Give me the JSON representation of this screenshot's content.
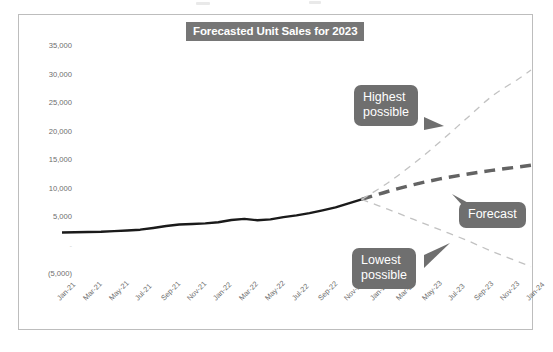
{
  "chart_data": {
    "type": "line",
    "title": "Forecasted Unit Sales for 2023",
    "xlabel": "",
    "ylabel": "",
    "ylim": [
      -5000,
      35000
    ],
    "grid": false,
    "legend_position": "none",
    "yticks": [
      35000,
      30000,
      25000,
      20000,
      15000,
      10000,
      5000,
      0,
      -5000
    ],
    "ytick_labels": [
      "35,000",
      "30,000",
      "25,000",
      "20,000",
      "15,000",
      "10,000",
      "5,000",
      "-",
      "(5,000)"
    ],
    "categories": [
      "Jan-21",
      "Mar-21",
      "May-21",
      "Jul-21",
      "Sep-21",
      "Nov-21",
      "Jan-22",
      "Mar-22",
      "May-22",
      "Jul-22",
      "Sep-22",
      "Nov-22",
      "Jan-23",
      "Mar-23",
      "May-23",
      "Jul-23",
      "Sep-23",
      "Nov-23",
      "Jan-24"
    ],
    "series": [
      {
        "name": "Actual",
        "style": "solid",
        "color": "#1a1a1a",
        "width": 2.4,
        "x": [
          "Jan-21",
          "Feb-21",
          "Mar-21",
          "Apr-21",
          "May-21",
          "Jun-21",
          "Jul-21",
          "Aug-21",
          "Sep-21",
          "Oct-21",
          "Nov-21",
          "Dec-21",
          "Jan-22",
          "Feb-22",
          "Mar-22",
          "Apr-22",
          "May-22",
          "Jun-22",
          "Jul-22",
          "Aug-22",
          "Sep-22",
          "Oct-22",
          "Nov-22",
          "Dec-22"
        ],
        "values": [
          2100,
          2150,
          2200,
          2250,
          2350,
          2450,
          2600,
          2900,
          3250,
          3500,
          3600,
          3700,
          3900,
          4300,
          4500,
          4250,
          4400,
          4800,
          5100,
          5500,
          6000,
          6500,
          7200,
          7900
        ]
      },
      {
        "name": "Forecast",
        "style": "dashed",
        "color": "#636363",
        "width": 3.4,
        "x": [
          "Dec-22",
          "Feb-23",
          "Apr-23",
          "Jun-23",
          "Aug-23",
          "Oct-23",
          "Dec-23",
          "Jan-24"
        ],
        "values": [
          7900,
          9300,
          10500,
          11500,
          12300,
          13000,
          13600,
          13900
        ]
      },
      {
        "name": "Highest possible",
        "style": "dashed",
        "color": "#c2c2c2",
        "width": 1.3,
        "x": [
          "Dec-22",
          "Feb-23",
          "Apr-23",
          "Jun-23",
          "Aug-23",
          "Oct-23",
          "Dec-23",
          "Jan-24"
        ],
        "values": [
          7900,
          10800,
          14200,
          18000,
          22000,
          26000,
          29000,
          30600
        ]
      },
      {
        "name": "Lowest possible",
        "style": "dashed",
        "color": "#c2c2c2",
        "width": 1.3,
        "x": [
          "Dec-22",
          "Feb-23",
          "Apr-23",
          "Jun-23",
          "Aug-23",
          "Oct-23",
          "Dec-23",
          "Jan-24"
        ],
        "values": [
          7900,
          6200,
          4400,
          2600,
          800,
          -1200,
          -3000,
          -3900
        ]
      }
    ],
    "annotations": [
      {
        "id": "highest",
        "text_line1": "Highest",
        "text_line2": "possible",
        "points_to": "Highest possible"
      },
      {
        "id": "forecast",
        "text_line1": "Forecast",
        "text_line2": "",
        "points_to": "Forecast"
      },
      {
        "id": "lowest",
        "text_line1": "Lowest",
        "text_line2": "possible",
        "points_to": "Lowest possible"
      }
    ]
  },
  "colors": {
    "title_background": "#767676",
    "title_text": "#ffffff",
    "callout_background": "#6f6f6f",
    "callout_text": "#ffffff",
    "actual_line": "#1a1a1a",
    "forecast_line": "#636363",
    "bound_line": "#c2c2c2",
    "axis_text": "#6d6d6d",
    "frame_border": "#bdbdbd",
    "plot_background": "#ffffff"
  }
}
